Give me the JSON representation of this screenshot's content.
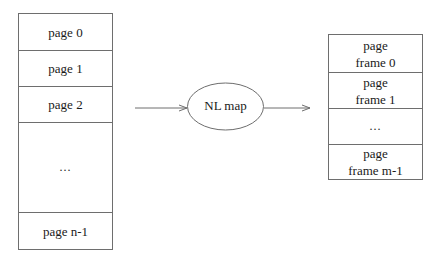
{
  "virtual_pages": {
    "label": "virtual pages",
    "cells": [
      {
        "text": "page 0"
      },
      {
        "text": "page 1"
      },
      {
        "text": "page 2"
      },
      {
        "text": "..."
      },
      {
        "text": "page n-1"
      }
    ]
  },
  "mapper": {
    "label": "NL map"
  },
  "physical_frames": {
    "label": "page frames",
    "cells": [
      {
        "line1": "page",
        "line2": "frame 0"
      },
      {
        "line1": "page",
        "line2": "frame 1"
      },
      {
        "line1": "...",
        "line2": ""
      },
      {
        "line1": "page",
        "line2": "frame m-1"
      }
    ]
  },
  "colors": {
    "line": "#6e6e6e",
    "text": "#1a1a1a",
    "background": "#ffffff"
  }
}
